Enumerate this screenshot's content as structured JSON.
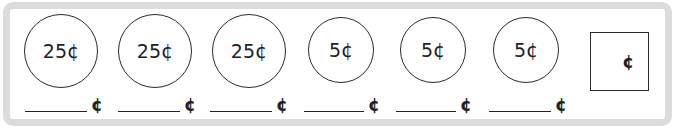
{
  "worksheet": {
    "coins": [
      {
        "label": "25¢",
        "value": 25
      },
      {
        "label": "25¢",
        "value": 25
      },
      {
        "label": "25¢",
        "value": 25
      },
      {
        "label": "5¢",
        "value": 5
      },
      {
        "label": "5¢",
        "value": 5
      },
      {
        "label": "5¢",
        "value": 5
      }
    ],
    "blanks": [
      {
        "unit": "¢",
        "value": ""
      },
      {
        "unit": "¢",
        "value": ""
      },
      {
        "unit": "¢",
        "value": ""
      },
      {
        "unit": "¢",
        "value": ""
      },
      {
        "unit": "¢",
        "value": ""
      },
      {
        "unit": "¢",
        "value": ""
      }
    ],
    "total": {
      "unit": "¢",
      "value": ""
    }
  }
}
